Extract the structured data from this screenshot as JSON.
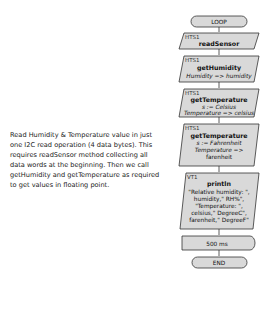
{
  "description": "Read Humidity & Temperature value in just one I2C read operation (4 data bytes). This requires readSensor method collecting all data words at the beginning. Then we call getHumidity and getTemperature as required to get values in floating point.",
  "flowchart": {
    "start": "LOOP",
    "blocks": [
      {
        "tag": "HTS1",
        "title": "readSensor",
        "lines": []
      },
      {
        "tag": "HTS1",
        "title": "getHumidity",
        "lines": [
          "Humidity => humidity"
        ]
      },
      {
        "tag": "HTS1",
        "title": "getTemperature",
        "lines": [
          "s := Celsius",
          "Temperature => celsius"
        ]
      },
      {
        "tag": "HTS1",
        "title": "getTemperature",
        "lines": [
          "s := Fahrenheit",
          "Temperature =>",
          "farenheit"
        ]
      },
      {
        "tag": "VT1",
        "title": "println",
        "lines": [
          "\"Relative humidity: \",",
          "humidity,\" RH%\",",
          "\"Temperature: \",",
          "celsius,\" DegreeC\",",
          "farenheit,\" DegreeF\""
        ]
      }
    ],
    "delay": "500 ms",
    "end": "END"
  },
  "colors": {
    "block_fill": "#d9d9d9",
    "stroke": "#333333",
    "background": "#ffffff"
  }
}
